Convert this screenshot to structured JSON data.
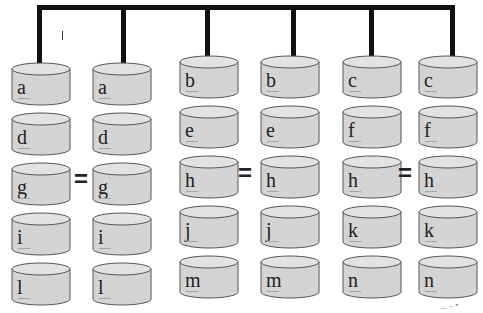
{
  "diagram": {
    "colors": {
      "bus": "#111111",
      "disk_fill": "#d4d4d4",
      "disk_top": "#e2e2e2",
      "disk_stroke": "#555555"
    },
    "groups": [
      {
        "columns": [
          {
            "disks": [
              "a",
              "d",
              "g",
              "i",
              "l"
            ]
          },
          {
            "disks": [
              "a",
              "d",
              "g",
              "i",
              "l"
            ]
          }
        ],
        "equals_row": 2
      },
      {
        "columns": [
          {
            "disks": [
              "b",
              "e",
              "h",
              "j",
              "m"
            ]
          },
          {
            "disks": [
              "b",
              "e",
              "h",
              "j",
              "m"
            ]
          }
        ],
        "equals_row": 2
      },
      {
        "columns": [
          {
            "disks": [
              "c",
              "f",
              "h",
              "k",
              "n"
            ]
          },
          {
            "disks": [
              "c",
              "f",
              "h",
              "k",
              "n"
            ]
          }
        ],
        "equals_row": 2
      }
    ],
    "equals_symbol": "=",
    "footnote": "… ·· ″"
  }
}
